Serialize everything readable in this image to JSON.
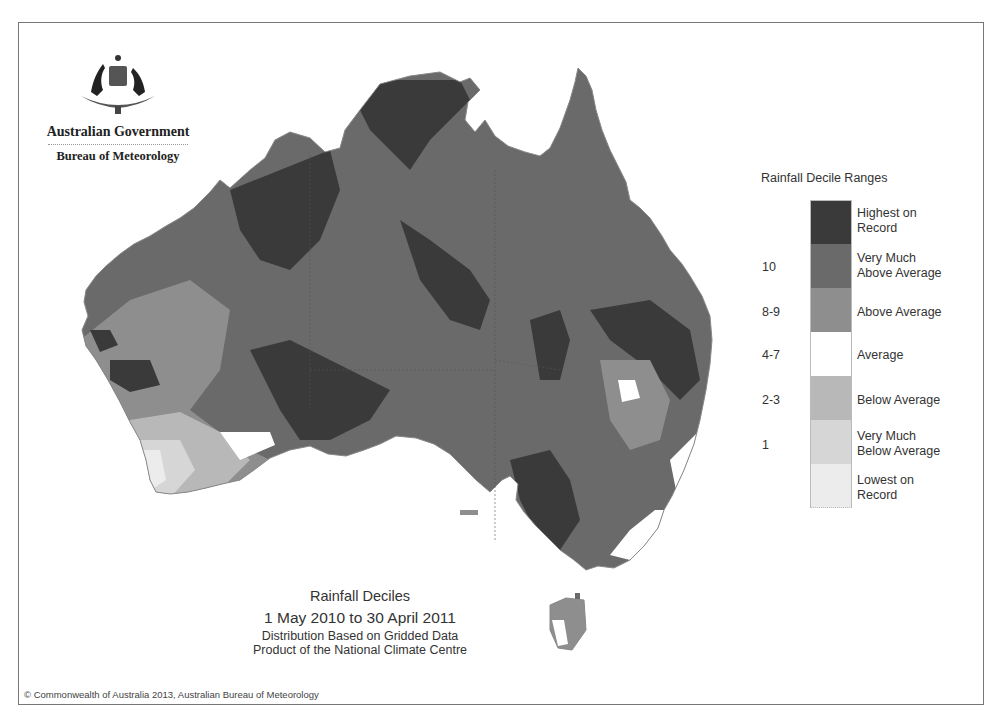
{
  "branding": {
    "government": "Australian Government",
    "agency": "Bureau of Meteorology",
    "crest_icon": "coat-of-arms-icon"
  },
  "titles": {
    "title": "Rainfall Deciles",
    "period": "1 May 2010 to 30 April 2011",
    "subtitle1": "Distribution Based on Gridded Data",
    "subtitle2": "Product of the National Climate Centre"
  },
  "legend": {
    "title": "Rainfall Decile Ranges",
    "items": [
      {
        "line1": "Highest on",
        "line2": "Record",
        "range": "",
        "color": "#3a3a3a"
      },
      {
        "line1": "Very Much",
        "line2": "Above Average",
        "range": "10",
        "color": "#6a6a6a"
      },
      {
        "line1": "Above Average",
        "line2": "",
        "range": "8-9",
        "color": "#8e8e8e"
      },
      {
        "line1": "Average",
        "line2": "",
        "range": "4-7",
        "color": "#ffffff"
      },
      {
        "line1": "Below Average",
        "line2": "",
        "range": "2-3",
        "color": "#b8b8b8"
      },
      {
        "line1": "Very Much",
        "line2": "Below Average",
        "range": "1",
        "color": "#d6d6d6"
      },
      {
        "line1": "Lowest on",
        "line2": "Record",
        "range": "",
        "color": "#ececec"
      }
    ]
  },
  "copyright": "© Commonwealth of Australia 2013, Australian Bureau of Meteorology",
  "map": {
    "region": "Australia",
    "dominant_category": "Very Much Above Average"
  }
}
